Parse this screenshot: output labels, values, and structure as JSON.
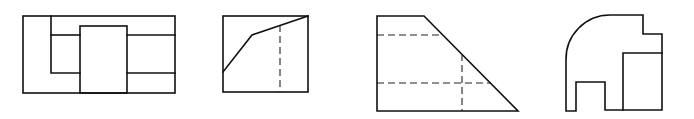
{
  "figures": [
    {
      "id": "view-1",
      "description": "rectangular front view with stepped inner outlines and central rectangle",
      "outer_rect": [
        23,
        16,
        175,
        93
      ],
      "inner_lines": [
        [
          [
            51,
            16
          ],
          [
            51,
            73
          ],
          [
            80,
            73
          ]
        ],
        [
          [
            51,
            35
          ],
          [
            80,
            35
          ]
        ],
        [
          [
            127,
            35
          ],
          [
            175,
            35
          ]
        ],
        [
          [
            127,
            73
          ],
          [
            175,
            73
          ]
        ]
      ],
      "center_rect": [
        80,
        26,
        127,
        93
      ]
    },
    {
      "id": "view-2",
      "description": "square view with sloped polyline and hidden vertical line",
      "outer_rect": [
        223,
        16,
        308,
        92
      ],
      "polyline": [
        [
          223,
          72
        ],
        [
          252,
          35
        ],
        [
          308,
          16
        ]
      ],
      "hidden_lines": [
        [
          [
            280,
            25
          ],
          [
            280,
            92
          ]
        ]
      ]
    },
    {
      "id": "view-3",
      "description": "trapezoid view with hidden horizontal and vertical lines",
      "outline": [
        [
          377,
          16
        ],
        [
          424,
          16
        ],
        [
          518,
          111
        ],
        [
          377,
          111
        ]
      ],
      "hidden_lines": [
        [
          [
            377,
            35
          ],
          [
            443,
            35
          ]
        ],
        [
          [
            377,
            83
          ],
          [
            491,
            83
          ]
        ],
        [
          [
            462,
            54
          ],
          [
            462,
            111
          ]
        ]
      ]
    },
    {
      "id": "view-4",
      "description": "profile with rounded top-left corner, step at top-right, notch at bottom and inner rectangle",
      "outline_path": "M566,111 L566,60 A44,44 0 0 1 610,15 L643,15 L643,34 L662,34 L662,110 L605,110 L605,82 L576,82 L576,111 Z",
      "inner_rect_lines": [
        [
          [
            623,
            110
          ],
          [
            623,
            53
          ],
          [
            662,
            53
          ]
        ]
      ]
    }
  ],
  "colors": {
    "line": "#111111",
    "hidden_line": "#222222",
    "background": "#ffffff"
  }
}
